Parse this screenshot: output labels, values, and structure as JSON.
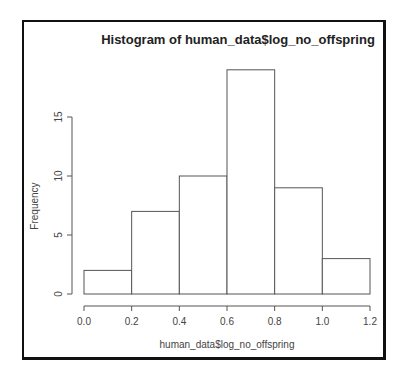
{
  "chart_data": {
    "type": "bar",
    "title": "Histogram of human_data$log_no_offspring",
    "xlabel": "human_data$log_no_offspring",
    "ylabel": "Frequency",
    "bin_edges": [
      0.0,
      0.2,
      0.4,
      0.6,
      0.8,
      1.0,
      1.2
    ],
    "categories": [
      "0.0-0.2",
      "0.2-0.4",
      "0.4-0.6",
      "0.6-0.8",
      "0.8-1.0",
      "1.0-1.2"
    ],
    "values": [
      2,
      7,
      10,
      19,
      9,
      3
    ],
    "x_ticks": [
      "0.0",
      "0.2",
      "0.4",
      "0.6",
      "0.8",
      "1.0",
      "1.2"
    ],
    "y_ticks": [
      "0",
      "5",
      "10",
      "15"
    ],
    "xlim": [
      0.0,
      1.2
    ],
    "ylim": [
      0,
      19
    ],
    "grid": false,
    "legend": null
  }
}
